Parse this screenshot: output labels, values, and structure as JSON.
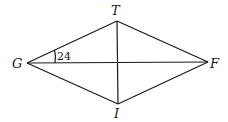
{
  "figure": {
    "type": "rhombus with diagonals",
    "vertices": {
      "T": {
        "label": "T",
        "x": 117,
        "y": 21
      },
      "F": {
        "label": "F",
        "x": 208,
        "y": 62
      },
      "I": {
        "label": "I",
        "x": 118,
        "y": 104
      },
      "G": {
        "label": "G",
        "x": 27,
        "y": 63
      }
    },
    "angle_marks": [
      {
        "vertex": "G",
        "between": [
          "GT",
          "GF"
        ],
        "value": "24"
      }
    ],
    "stroke_color": "#1a1a1a",
    "background": "#ffffff"
  }
}
